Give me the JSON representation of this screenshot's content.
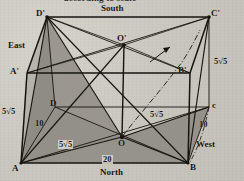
{
  "figure": {
    "type": "3d-box-diagram",
    "caption_cut_off": "according to scale",
    "vertices": [
      {
        "id": "A",
        "label": "A",
        "x": 21,
        "y": 163
      },
      {
        "id": "B",
        "label": "B",
        "x": 188,
        "y": 163
      },
      {
        "id": "C",
        "label": "c",
        "x": 209,
        "y": 107
      },
      {
        "id": "D",
        "label": "D",
        "x": 55,
        "y": 107
      },
      {
        "id": "Ap",
        "label": "A'",
        "x": 27,
        "y": 73
      },
      {
        "id": "Bp",
        "label": "B'",
        "x": 190,
        "y": 73
      },
      {
        "id": "Cp",
        "label": "C'",
        "x": 209,
        "y": 17
      },
      {
        "id": "Dp",
        "label": "D'",
        "x": 47,
        "y": 17
      },
      {
        "id": "O",
        "label": "O",
        "x": 122,
        "y": 137
      },
      {
        "id": "Op",
        "label": "O'",
        "x": 124,
        "y": 45
      }
    ],
    "direction_labels": [
      {
        "name": "south",
        "text": "South",
        "x": 101,
        "y": 8
      },
      {
        "name": "north",
        "text": "North",
        "x": 100,
        "y": 170
      },
      {
        "name": "east",
        "text": "East",
        "x": 9,
        "y": 44
      },
      {
        "name": "west",
        "text": "West",
        "x": 198,
        "y": 143
      }
    ],
    "measure_labels": [
      {
        "name": "edge-AAp",
        "value": "5√5",
        "x": 3,
        "y": 110,
        "boxed": false
      },
      {
        "name": "edge-CCp",
        "value": "5√5",
        "x": 215,
        "y": 60,
        "boxed": false
      },
      {
        "name": "diag-AO",
        "value": "5√5",
        "x": 62,
        "y": 143,
        "boxed": true
      },
      {
        "name": "diag-OC",
        "value": "5√5",
        "x": 152,
        "y": 113,
        "boxed": false
      },
      {
        "name": "edge-AD",
        "value": "10",
        "x": 37,
        "y": 122,
        "boxed": false
      },
      {
        "name": "edge-BC",
        "value": "10",
        "x": 200,
        "y": 122,
        "boxed": false
      },
      {
        "name": "edge-AB",
        "value": "20",
        "x": 104,
        "y": 158,
        "boxed": true
      }
    ],
    "colors": {
      "ink": "#16140f",
      "paper": "#cbc8c1",
      "shade_dark": "#8e8b84",
      "shade_light": "#a5a29b",
      "dashdot": "#2a2721"
    },
    "shaded_faces": [
      {
        "name": "triangle-Dp-A-D",
        "points": "47,17 21,163 55,107"
      },
      {
        "name": "triangle-Dp-A-O",
        "points": "47,17 21,163 122,137"
      },
      {
        "name": "triangle-A-O-B",
        "points": "21,163 122,137 188,163"
      },
      {
        "name": "triangle-O-B-C",
        "points": "122,137 188,163 209,107"
      }
    ],
    "arrow_annotation": {
      "name": "curved-arrow",
      "present": true
    }
  }
}
